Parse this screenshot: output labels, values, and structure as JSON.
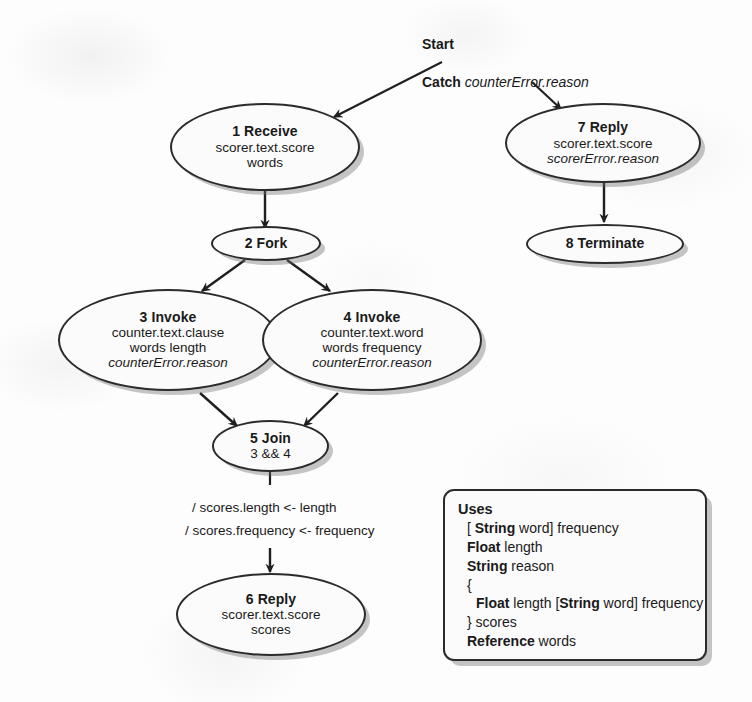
{
  "diagram": {
    "labels": {
      "start": "Start",
      "catch_keyword": "Catch",
      "catch_variable": "counterError.reason"
    },
    "nodes": [
      {
        "id": "n1",
        "title": "1 Receive",
        "lines": [
          "scorer.text.score",
          "words"
        ],
        "italic": [
          false,
          false
        ]
      },
      {
        "id": "n2",
        "title": "2 Fork",
        "lines": [],
        "italic": []
      },
      {
        "id": "n3",
        "title": "3 Invoke",
        "lines": [
          "counter.text.clause",
          "words length",
          "counterError.reason"
        ],
        "italic": [
          false,
          false,
          true
        ]
      },
      {
        "id": "n4",
        "title": "4 Invoke",
        "lines": [
          "counter.text.word",
          "words frequency",
          "counterError.reason"
        ],
        "italic": [
          false,
          false,
          true
        ]
      },
      {
        "id": "n5",
        "title": "5 Join",
        "lines": [
          "3 && 4"
        ],
        "italic": [
          false
        ]
      },
      {
        "id": "n6",
        "title": "6 Reply",
        "lines": [
          "scorer.text.score",
          "scores"
        ],
        "italic": [
          false,
          false
        ]
      },
      {
        "id": "n7",
        "title": "7 Reply",
        "lines": [
          "scorer.text.score",
          "scorerError.reason"
        ],
        "italic": [
          false,
          true
        ]
      },
      {
        "id": "n8",
        "title": "8 Terminate",
        "lines": [],
        "italic": []
      }
    ],
    "edge_annotations": {
      "join_to_reply_line1": "/ scores.length <- length",
      "join_to_reply_line2": "/ scores.frequency <- frequency"
    },
    "uses_box": {
      "title": "Uses",
      "lines": [
        {
          "indent": 1,
          "parts": [
            {
              "t": "[ ",
              "b": false
            },
            {
              "t": "String",
              "b": true
            },
            {
              "t": " word] frequency",
              "b": false
            }
          ]
        },
        {
          "indent": 1,
          "parts": [
            {
              "t": "Float",
              "b": true
            },
            {
              "t": " length",
              "b": false
            }
          ]
        },
        {
          "indent": 1,
          "parts": [
            {
              "t": "String",
              "b": true
            },
            {
              "t": " reason",
              "b": false
            }
          ]
        },
        {
          "indent": 1,
          "parts": [
            {
              "t": "{",
              "b": false
            }
          ]
        },
        {
          "indent": 2,
          "parts": [
            {
              "t": "Float",
              "b": true
            },
            {
              "t": " length [",
              "b": false
            },
            {
              "t": "String",
              "b": true
            },
            {
              "t": " word] frequency",
              "b": false
            }
          ]
        },
        {
          "indent": 1,
          "parts": [
            {
              "t": "} scores",
              "b": false
            }
          ]
        },
        {
          "indent": 1,
          "parts": [
            {
              "t": "Reference",
              "b": true
            },
            {
              "t": " words",
              "b": false
            }
          ]
        }
      ]
    },
    "colors": {
      "ink": "#2b2b2b",
      "paper": "#fdfdfd",
      "shadow": "rgba(110,110,110,0.40)"
    }
  }
}
